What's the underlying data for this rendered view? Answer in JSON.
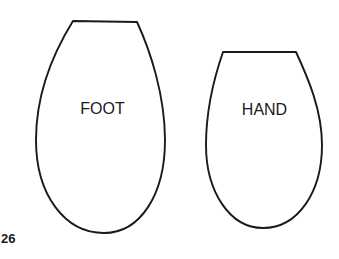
{
  "diagram": {
    "shapes": [
      {
        "id": "foot",
        "label": "FOOT",
        "shape": "truncated-egg-outline"
      },
      {
        "id": "hand",
        "label": "HAND",
        "shape": "truncated-egg-outline"
      }
    ],
    "page_number": "26"
  },
  "colors": {
    "stroke": "#1a1a1a",
    "background": "#ffffff"
  }
}
